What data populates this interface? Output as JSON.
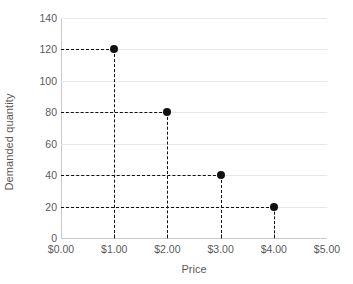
{
  "chart_data": {
    "type": "scatter",
    "title": "",
    "xlabel": "Price",
    "ylabel": "Demanded quantity",
    "x": [
      1.0,
      2.0,
      3.0,
      4.0
    ],
    "values": [
      120,
      80,
      40,
      20
    ],
    "point_labels": [
      "$1.00, 120",
      "$2.00, 80",
      "$3.00, 40",
      "$4.00, 20"
    ],
    "xlim": [
      0,
      5
    ],
    "ylim": [
      0,
      140
    ],
    "x_tick_labels": [
      "$0.00",
      "$1.00",
      "$2.00",
      "$3.00",
      "$4.00",
      "$5.00"
    ],
    "x_tick_values": [
      0,
      1,
      2,
      3,
      4,
      5
    ],
    "y_tick_labels": [
      "0",
      "20",
      "40",
      "60",
      "80",
      "100",
      "120",
      "140"
    ],
    "y_tick_values": [
      0,
      20,
      40,
      60,
      80,
      100,
      120,
      140
    ],
    "grid": "horizontal",
    "legend": "none",
    "series_name": "Demand schedule",
    "guide_lines": "dashed drop lines from each point to both axes",
    "colors": {
      "point": "#111111",
      "guide": "#111111",
      "gridline": "#e8e8e8",
      "axis": "#c9c9c9",
      "text": "#595959",
      "background": "#ffffff"
    }
  }
}
